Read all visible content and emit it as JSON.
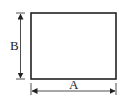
{
  "diagram": {
    "shape": "rectangle",
    "labels": {
      "width": "A",
      "height": "B"
    },
    "colors": {
      "stroke": "#222222",
      "background": "#ffffff"
    }
  }
}
